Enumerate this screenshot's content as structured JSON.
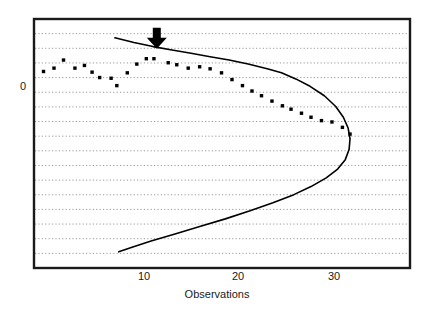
{
  "chart_data": {
    "type": "scatter",
    "title": "",
    "subtitle": "",
    "xlabel": "Observations",
    "ylabel": "",
    "xlim": [
      0.5,
      40
    ],
    "ylim": [
      -14.5,
      4.0
    ],
    "xticks": [
      10,
      20,
      30
    ],
    "xticklabels": [
      "10",
      "20",
      "30"
    ],
    "yticks": [
      0
    ],
    "yticklabels": [
      "0"
    ],
    "grid": "horizontal-dotted",
    "legend": "none",
    "series": [
      {
        "name": "observations",
        "type": "scatter",
        "marker": "square",
        "color": "#000000",
        "points": [
          [
            1.5,
            0.1
          ],
          [
            2.6,
            0.35
          ],
          [
            3.6,
            0.95
          ],
          [
            4.8,
            0.35
          ],
          [
            5.8,
            0.55
          ],
          [
            6.6,
            0.05
          ],
          [
            7.4,
            -0.35
          ],
          [
            8.6,
            -0.4
          ],
          [
            9.2,
            -0.95
          ],
          [
            10.3,
            0.0
          ],
          [
            11.3,
            0.65
          ],
          [
            12.3,
            1.05
          ],
          [
            13.1,
            1.05
          ],
          [
            14.6,
            0.75
          ],
          [
            15.5,
            0.6
          ],
          [
            16.7,
            0.35
          ],
          [
            17.9,
            0.45
          ],
          [
            19.0,
            0.3
          ],
          [
            20.2,
            0.0
          ],
          [
            21.3,
            -0.5
          ],
          [
            22.4,
            -0.95
          ],
          [
            23.4,
            -1.35
          ],
          [
            24.4,
            -1.7
          ],
          [
            25.5,
            -2.1
          ],
          [
            26.6,
            -2.45
          ],
          [
            27.5,
            -2.7
          ],
          [
            28.6,
            -3.0
          ],
          [
            29.6,
            -3.3
          ],
          [
            30.7,
            -3.55
          ],
          [
            31.8,
            -3.65
          ],
          [
            32.9,
            -4.05
          ],
          [
            33.7,
            -4.55
          ]
        ]
      },
      {
        "name": "fitted-curve",
        "type": "line",
        "color": "#000000",
        "points": [
          [
            9.0,
            2.6
          ],
          [
            11.0,
            2.25
          ],
          [
            13.0,
            1.95
          ],
          [
            15.0,
            1.7
          ],
          [
            17.0,
            1.45
          ],
          [
            19.0,
            1.2
          ],
          [
            21.0,
            0.95
          ],
          [
            23.0,
            0.65
          ],
          [
            25.0,
            0.3
          ],
          [
            26.5,
            0.0
          ],
          [
            28.0,
            -0.45
          ],
          [
            29.5,
            -1.0
          ],
          [
            31.0,
            -1.7
          ],
          [
            32.2,
            -2.5
          ],
          [
            33.0,
            -3.3
          ],
          [
            33.5,
            -4.1
          ],
          [
            33.7,
            -4.9
          ],
          [
            33.6,
            -5.7
          ],
          [
            33.2,
            -6.45
          ],
          [
            32.4,
            -7.15
          ],
          [
            31.2,
            -7.8
          ],
          [
            29.6,
            -8.45
          ],
          [
            27.8,
            -9.05
          ],
          [
            25.6,
            -9.65
          ],
          [
            23.2,
            -10.25
          ],
          [
            20.6,
            -10.85
          ],
          [
            18.0,
            -11.4
          ],
          [
            15.4,
            -11.95
          ],
          [
            12.8,
            -12.5
          ],
          [
            10.8,
            -12.95
          ],
          [
            9.4,
            -13.3
          ]
        ]
      }
    ],
    "annotations": [
      {
        "name": "down-arrow-marker",
        "shape": "down-arrow",
        "x": 13.4,
        "y": 3.35,
        "color": "#000000"
      }
    ]
  },
  "axes": {
    "frame_color": "#1a1a1a",
    "grid_color": "#999999",
    "tick_label_color": "#1a1a1a"
  }
}
